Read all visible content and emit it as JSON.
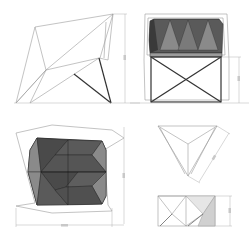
{
  "drawing": {
    "title": "",
    "subject": "faceted chair orthographic drawings",
    "views": [
      {
        "id": "side-view",
        "label": ""
      },
      {
        "id": "front-view",
        "label": ""
      },
      {
        "id": "top-view",
        "label": ""
      },
      {
        "id": "triangle-plan-view",
        "label": ""
      },
      {
        "id": "triangle-elevation-view",
        "label": ""
      }
    ],
    "dimensions": {
      "side_height": "",
      "front_leg_height": "",
      "top_depth": "",
      "top_width": "",
      "triangle_side": "",
      "triangle_height": ""
    },
    "colors": {
      "line": "#9a9a9a",
      "frame": "#333333",
      "facet_dark": "#4a4a4a",
      "facet_mid": "#6e6e6e",
      "facet_light": "#8c8c8c",
      "facet_pale": "#d8d8d8",
      "background": "#ffffff"
    }
  }
}
